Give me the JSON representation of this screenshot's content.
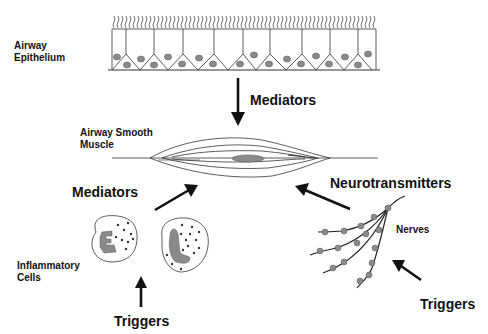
{
  "diagram": {
    "labels": {
      "airway_epithelium": [
        "Airway",
        "Epithelium"
      ],
      "mediators_top": "Mediators",
      "airway_smooth_muscle": [
        "Airway Smooth",
        "Muscle"
      ],
      "mediators_left": "Mediators",
      "neurotransmitters": "Neurotransmitters",
      "nerves": "Nerves",
      "inflammatory_cells": [
        "Inflammatory",
        "Cells"
      ],
      "triggers_bottom": "Triggers",
      "triggers_right": "Triggers"
    },
    "colors": {
      "line": "#222222",
      "nucleus_fill": "#8a8a8a",
      "background": "#ffffff"
    }
  }
}
